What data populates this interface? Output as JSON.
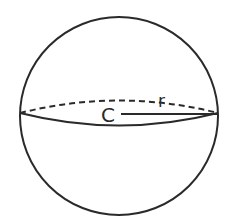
{
  "figure": {
    "type": "sphere",
    "center_label": "C",
    "radius_label": "r",
    "stroke_color": "#2a2a2a",
    "background_color": "#ffffff"
  }
}
